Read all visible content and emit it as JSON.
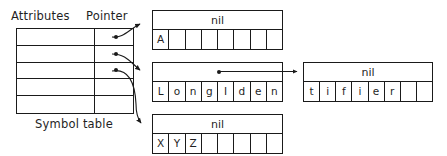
{
  "figure": {
    "caption_labels": {
      "attributes": "Attributes",
      "pointer": "Pointer",
      "symbol_table": "Symbol table"
    },
    "colors": {
      "ink": "#1a1a1a",
      "background": "#ffffff"
    }
  },
  "symbol_table": {
    "columns": [
      "Attributes",
      "Pointer"
    ],
    "row_count": 5,
    "rows": [
      {
        "attributes": "",
        "pointer": "dot",
        "has_pointer": true
      },
      {
        "attributes": "",
        "pointer": "dot",
        "has_pointer": true
      },
      {
        "attributes": "",
        "pointer": "dot",
        "has_pointer": true
      },
      {
        "attributes": "",
        "pointer": "",
        "has_pointer": false
      },
      {
        "attributes": "",
        "pointer": "",
        "has_pointer": false
      }
    ]
  },
  "blocks": [
    {
      "id": "block-a",
      "header": "nil",
      "header_kind": "nil",
      "cells": [
        "A",
        "",
        "",
        "",
        "",
        "",
        "",
        ""
      ]
    },
    {
      "id": "block-long",
      "header": "",
      "header_kind": "pointer",
      "cells": [
        "L",
        "o",
        "n",
        "g",
        "I",
        "d",
        "e",
        "n"
      ]
    },
    {
      "id": "block-tifier",
      "header": "nil",
      "header_kind": "nil",
      "cells": [
        "t",
        "i",
        "f",
        "i",
        "e",
        "r",
        "",
        ""
      ]
    },
    {
      "id": "block-xyz",
      "header": "nil",
      "header_kind": "nil",
      "cells": [
        "X",
        "Y",
        "Z",
        "",
        "",
        "",
        "",
        ""
      ]
    }
  ],
  "arrows": [
    {
      "name": "pointer-row1-to-block-a",
      "from": "symbol-table row 1 pointer",
      "to": "block-a"
    },
    {
      "name": "pointer-row2-to-block-long",
      "from": "symbol-table row 2 pointer",
      "to": "block-long"
    },
    {
      "name": "pointer-row3-to-block-xyz",
      "from": "symbol-table row 3 pointer",
      "to": "block-xyz"
    },
    {
      "name": "pointer-long-to-tifier",
      "from": "block-long header pointer",
      "to": "block-tifier"
    }
  ]
}
